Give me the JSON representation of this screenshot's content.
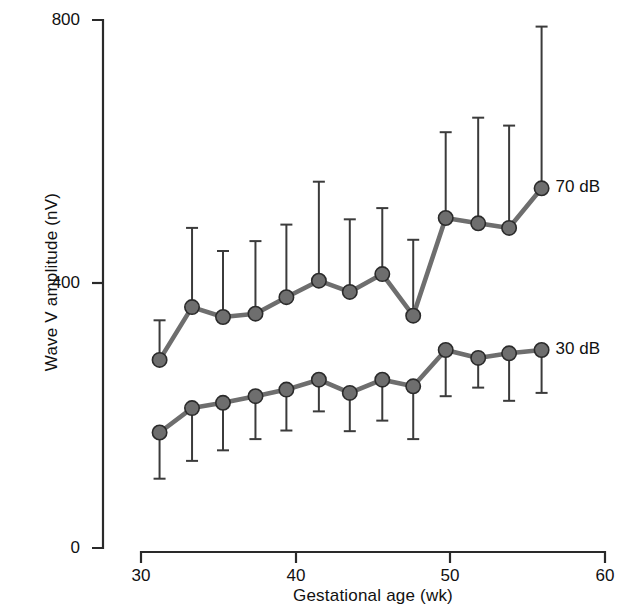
{
  "chart_data": {
    "type": "line",
    "title": "",
    "xlabel": "Gestational age (wk)",
    "ylabel": "Wave V amplitude (nV)",
    "xlim": [
      30,
      60
    ],
    "ylim": [
      0,
      800
    ],
    "xticks": [
      30,
      40,
      50,
      60
    ],
    "yticks": [
      0,
      400,
      800
    ],
    "xtick_labels": [
      "30",
      "40",
      "50",
      "60"
    ],
    "ytick_labels": [
      "0",
      "400",
      "800"
    ],
    "grid": false,
    "legend_position": "right-of-line-ends",
    "errorbars": "one-sided standard deviation",
    "marker": "filled gray circle",
    "series": [
      {
        "name": "70 dB",
        "label": "70 dB",
        "color": "#6e6e6e",
        "line_color": "#6e6e6e",
        "errorbar_direction": "up",
        "x": [
          31.2,
          33.3,
          35.3,
          37.4,
          39.4,
          41.5,
          43.5,
          45.6,
          47.6,
          49.7,
          51.8,
          53.8,
          55.9
        ],
        "values": [
          285,
          365,
          350,
          355,
          380,
          405,
          388,
          415,
          352,
          500,
          492,
          485,
          545
        ],
        "errors_upper": [
          60,
          120,
          100,
          110,
          110,
          150,
          110,
          100,
          115,
          130,
          160,
          155,
          245
        ]
      },
      {
        "name": "30 dB",
        "label": "30 dB",
        "color": "#6e6e6e",
        "line_color": "#6e6e6e",
        "errorbar_direction": "down",
        "x": [
          31.2,
          33.3,
          35.3,
          37.4,
          39.4,
          41.5,
          43.5,
          45.6,
          47.6,
          49.7,
          51.8,
          53.8,
          55.9
        ],
        "values": [
          175,
          212,
          220,
          230,
          240,
          255,
          235,
          255,
          245,
          300,
          288,
          295,
          300
        ],
        "errors_lower": [
          70,
          80,
          72,
          65,
          62,
          48,
          58,
          62,
          80,
          70,
          45,
          72,
          65
        ]
      }
    ]
  },
  "axes": {
    "y_title": "Wave V amplitude (nV)",
    "x_title": "Gestational age (wk)"
  },
  "labels": {
    "series_70db": "70 dB",
    "series_30db": "30 dB",
    "y0": "0",
    "y400": "400",
    "y800": "800",
    "x30": "30",
    "x40": "40",
    "x50": "50",
    "x60": "60"
  }
}
